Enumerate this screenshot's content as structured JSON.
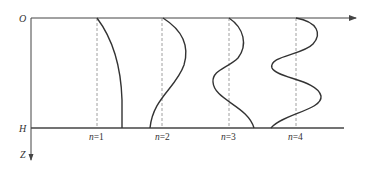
{
  "diagram": {
    "title": "",
    "axes": {
      "origin_label": "O",
      "bottom_label": "H",
      "depth_axis_label": "Z"
    },
    "modes": [
      {
        "n_var": "n",
        "eq": "=",
        "n": "1",
        "label": "n=1"
      },
      {
        "n_var": "n",
        "eq": "=",
        "n": "2",
        "label": "n=2"
      },
      {
        "n_var": "n",
        "eq": "=",
        "n": "3",
        "label": "n=3"
      },
      {
        "n_var": "n",
        "eq": "=",
        "n": "4",
        "label": "n=4"
      }
    ],
    "colors": {
      "line": "#333333",
      "axis": "#444444",
      "dashed": "#888888",
      "background": "#ffffff"
    }
  }
}
